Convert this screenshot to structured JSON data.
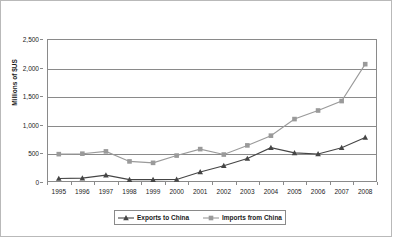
{
  "chart_data": {
    "type": "line",
    "title": "",
    "xlabel": "",
    "ylabel": "Millions of $US",
    "categories": [
      "1995",
      "1996",
      "1997",
      "1998",
      "1999",
      "2000",
      "2001",
      "2002",
      "2003",
      "2004",
      "2005",
      "2006",
      "2007",
      "2008"
    ],
    "ylim": [
      0,
      2500
    ],
    "yticks": [
      0,
      500,
      1000,
      1500,
      2000,
      2500
    ],
    "ytick_labels": [
      "0",
      "500",
      "1,000",
      "1,500",
      "2,000",
      "2,500"
    ],
    "grid": true,
    "legend_position": "bottom-center",
    "series": [
      {
        "name": "Exports to China",
        "marker": "triangle",
        "color": "#454545",
        "values": [
          60,
          68,
          120,
          42,
          42,
          45,
          175,
          285,
          410,
          600,
          510,
          490,
          600,
          780
        ]
      },
      {
        "name": "Imports from China",
        "marker": "square",
        "color": "#9a9a9a",
        "values": [
          487,
          495,
          535,
          360,
          335,
          462,
          575,
          480,
          640,
          810,
          1100,
          1250,
          1415,
          2060
        ]
      }
    ]
  },
  "axis": {
    "y_title": "Millions of $US"
  },
  "legend": {
    "items": [
      {
        "label": "Exports to China"
      },
      {
        "label": "Imports from China"
      }
    ]
  }
}
